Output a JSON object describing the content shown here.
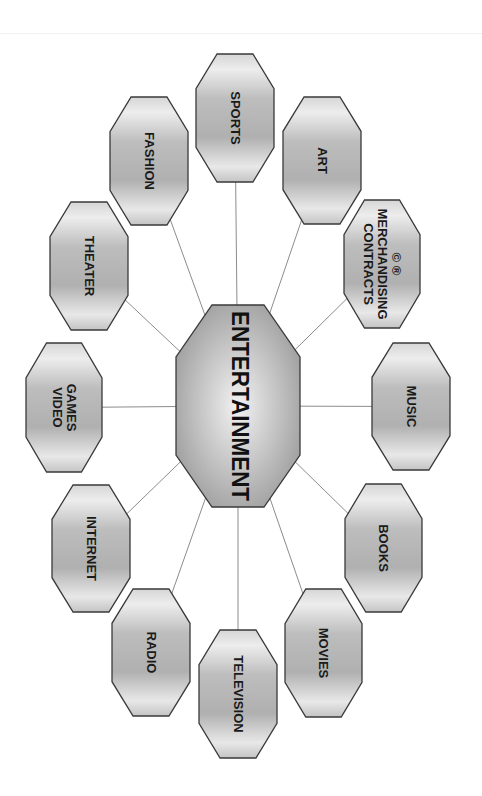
{
  "diagram": {
    "type": "hub-and-spoke",
    "orientation": "rotated 90deg clockwise",
    "colors": {
      "node_fill_light": "#e6e6e6",
      "node_fill_dark": "#a8a8a8",
      "node_stroke": "#3a3a3a",
      "connector": "#8c8c8c",
      "text": "#1a1a1a"
    },
    "center": {
      "label": "ENTERTAINMENT",
      "box": {
        "x": 176,
        "y": 305,
        "w": 124,
        "h": 202
      }
    },
    "nodes": [
      {
        "id": "sports",
        "lines": [
          "SPORTS"
        ],
        "box": {
          "x": 196,
          "y": 54,
          "w": 78,
          "h": 128
        }
      },
      {
        "id": "art",
        "lines": [
          "ART"
        ],
        "box": {
          "x": 283,
          "y": 97,
          "w": 78,
          "h": 127
        }
      },
      {
        "id": "contracts-merchandising",
        "lines": [
          "CONTRACTS",
          "MERCHANDISING",
          "©    ®"
        ],
        "box": {
          "x": 344,
          "y": 200,
          "w": 76,
          "h": 128
        }
      },
      {
        "id": "music",
        "lines": [
          "MUSIC"
        ],
        "box": {
          "x": 372,
          "y": 343,
          "w": 78,
          "h": 127
        }
      },
      {
        "id": "books",
        "lines": [
          "BOOKS"
        ],
        "box": {
          "x": 345,
          "y": 484,
          "w": 77,
          "h": 128
        }
      },
      {
        "id": "movies",
        "lines": [
          "MOVIES"
        ],
        "box": {
          "x": 285,
          "y": 589,
          "w": 77,
          "h": 128
        }
      },
      {
        "id": "television",
        "lines": [
          "TELEVISION"
        ],
        "box": {
          "x": 199,
          "y": 630,
          "w": 78,
          "h": 128
        }
      },
      {
        "id": "radio",
        "lines": [
          "RADIO"
        ],
        "box": {
          "x": 112,
          "y": 589,
          "w": 78,
          "h": 127
        }
      },
      {
        "id": "internet",
        "lines": [
          "INTERNET"
        ],
        "box": {
          "x": 52,
          "y": 485,
          "w": 78,
          "h": 127
        }
      },
      {
        "id": "video-games",
        "lines": [
          "VIDEO",
          "GAMES"
        ],
        "box": {
          "x": 26,
          "y": 343,
          "w": 76,
          "h": 129
        }
      },
      {
        "id": "theater",
        "lines": [
          "THEATER"
        ],
        "box": {
          "x": 50,
          "y": 202,
          "w": 78,
          "h": 128
        }
      },
      {
        "id": "fashion",
        "lines": [
          "FASHION"
        ],
        "box": {
          "x": 110,
          "y": 97,
          "w": 78,
          "h": 128
        }
      }
    ]
  }
}
